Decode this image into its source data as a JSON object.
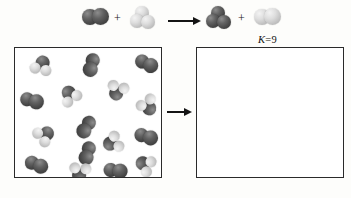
{
  "figure": {
    "type": "reaction-box-diagram"
  },
  "equation": {
    "reactant1": {
      "name": "dark-diatomic-molecule",
      "formula": "A2"
    },
    "plus1": "+",
    "reactant2": {
      "name": "light-triatomic-molecule",
      "formula": "B3"
    },
    "arrow": "→",
    "product1": {
      "name": "dark-triatomic-molecule",
      "formula": "A3"
    },
    "plus2": "+",
    "product2": {
      "name": "light-diatomic-molecule",
      "formula": "B2"
    }
  },
  "equilibrium_constant": {
    "symbol": "K",
    "equals": "=",
    "value": "9",
    "text": "K = 9"
  },
  "left_box": {
    "label": "initial-mixture-box",
    "molecules": [
      {
        "type": "mixed-triatomic",
        "x": 15,
        "y": 8,
        "rot": 18
      },
      {
        "type": "dark-diatomic",
        "x": 60,
        "y": 5,
        "rot": 108
      },
      {
        "type": "dark-diatomic",
        "x": 118,
        "y": 7,
        "rot": 28
      },
      {
        "type": "mixed-triatomic",
        "x": 88,
        "y": 28,
        "rot": 200
      },
      {
        "type": "mixed-triatomic",
        "x": 45,
        "y": 36,
        "rot": 330
      },
      {
        "type": "dark-diatomic",
        "x": 4,
        "y": 44,
        "rot": 18
      },
      {
        "type": "mixed-triatomic",
        "x": 117,
        "y": 45,
        "rot": 150
      },
      {
        "type": "dark-diatomic",
        "x": 55,
        "y": 66,
        "rot": 125
      },
      {
        "type": "mixed-triatomic",
        "x": 16,
        "y": 78,
        "rot": 55
      },
      {
        "type": "mixed-triatomic",
        "x": 86,
        "y": 80,
        "rot": 250
      },
      {
        "type": "dark-diatomic",
        "x": 118,
        "y": 80,
        "rot": 20
      },
      {
        "type": "dark-diatomic",
        "x": 56,
        "y": 93,
        "rot": 110
      },
      {
        "type": "dark-diatomic",
        "x": 8,
        "y": 108,
        "rot": 25
      },
      {
        "type": "mixed-triatomic",
        "x": 50,
        "y": 110,
        "rot": 190
      },
      {
        "type": "dark-diatomic",
        "x": 88,
        "y": 114,
        "rot": 10
      },
      {
        "type": "mixed-triatomic",
        "x": 120,
        "y": 104,
        "rot": 300
      }
    ],
    "counts": {
      "dark_diatomic": 7,
      "mixed_triatomic": 9
    }
  },
  "right_box": {
    "label": "equilibrium-mixture-box",
    "molecules": [],
    "empty": true
  },
  "colors": {
    "dark_atom": "#4a4a4a",
    "light_atom": "#c8c8c8",
    "box_border": "#2a2a2a",
    "arrow": "#141414",
    "background": "#fdfdfb"
  }
}
